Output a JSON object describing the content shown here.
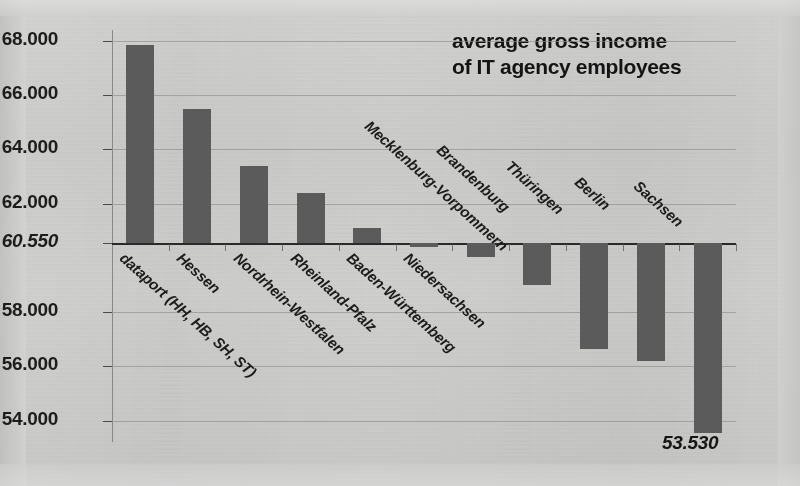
{
  "title": {
    "line1": "average gross income",
    "line2": "of IT agency employees"
  },
  "annotation": {
    "min_value_label": "53.530"
  },
  "axis": {
    "y_ticks": [
      "68.000",
      "66.000",
      "64.000",
      "62.000",
      "60.550",
      "58.000",
      "56.000",
      "54.000"
    ],
    "baseline_label": "60.550"
  },
  "chart_data": {
    "type": "bar",
    "title": "average gross income of IT agency employees",
    "xlabel": "",
    "ylabel": "",
    "ylim": [
      53000,
      68500
    ],
    "baseline": 60550,
    "grid": true,
    "legend": "none",
    "yticks": [
      68000,
      66000,
      64000,
      62000,
      60550,
      58000,
      56000,
      54000
    ],
    "ytick_labels": [
      "68.000",
      "66.000",
      "64.000",
      "62.000",
      "60.550",
      "58.000",
      "56.000",
      "54.000"
    ],
    "categories": [
      "dataport (HH, HB, SH, ST)",
      "Hessen",
      "Nordrhein-Westfalen",
      "Rheinland-Pfalz",
      "Baden-Württemberg",
      "Niedersachsen",
      "Mecklenburg-Vorpommern",
      "Brandenburg",
      "Thüringen",
      "Berlin",
      "Sachsen"
    ],
    "values": [
      67850,
      65500,
      63400,
      62400,
      61100,
      60400,
      60050,
      59000,
      56650,
      56200,
      53530
    ],
    "annotations": [
      {
        "category": "Sachsen",
        "text": "53.530"
      }
    ]
  },
  "bars": [
    {
      "label": "dataport (HH, HB, SH, ST)",
      "value": 67850
    },
    {
      "label": "Hessen",
      "value": 65500
    },
    {
      "label": "Nordrhein-Westfalen",
      "value": 63400
    },
    {
      "label": "Rheinland-Pfalz",
      "value": 62400
    },
    {
      "label": "Baden-Württemberg",
      "value": 61100
    },
    {
      "label": "Niedersachsen",
      "value": 60400
    },
    {
      "label": "Mecklenburg-Vorpommern",
      "value": 60050
    },
    {
      "label": "Brandenburg",
      "value": 59000
    },
    {
      "label": "Thüringen",
      "value": 56650
    },
    {
      "label": "Berlin",
      "value": 56200
    },
    {
      "label": "Sachsen",
      "value": 53530
    }
  ],
  "colors": {
    "bar": "#5b5b5b",
    "background": "#cfcfcd",
    "text": "#1c1c1c",
    "gridline": "#8e8e8c",
    "baseline": "#2a2a2a"
  }
}
